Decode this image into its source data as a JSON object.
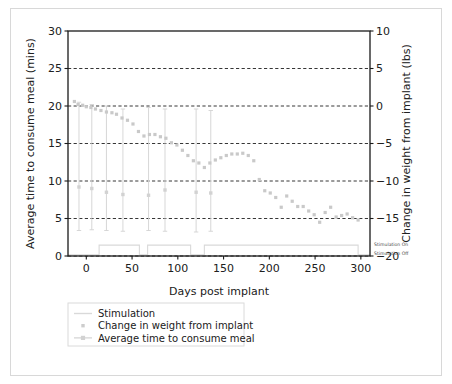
{
  "chart_data": {
    "type": "scatter",
    "title": "",
    "xlabel": "Days post implant",
    "ylabel": "Average time to consume meal (mins)",
    "y2label": "Change in weight from implant (lbs)",
    "xlim": [
      -20,
      310
    ],
    "ylim": [
      0,
      30
    ],
    "y2lim": [
      -20,
      10
    ],
    "xticks": [
      0,
      50,
      100,
      150,
      200,
      250,
      300
    ],
    "yticks": [
      0,
      5,
      10,
      15,
      20,
      25,
      30
    ],
    "y2ticks": [
      -20,
      -15,
      -10,
      -5,
      0,
      5,
      10
    ],
    "grid": true,
    "grid_style": "dashed horizontal",
    "legend_position": "below-left",
    "series": [
      {
        "name": "Stimulation",
        "type": "step",
        "marker": "line",
        "color": "#d9d9d9",
        "axis": "stimulation",
        "annotation_on": "Stimulation On",
        "annotation_off": "Stimulation Off",
        "points": [
          {
            "x": -20,
            "state": "off"
          },
          {
            "x": 14,
            "state": "on"
          },
          {
            "x": 58,
            "state": "off"
          },
          {
            "x": 67,
            "state": "on"
          },
          {
            "x": 114,
            "state": "off"
          },
          {
            "x": 129,
            "state": "on"
          },
          {
            "x": 297,
            "state": "off"
          },
          {
            "x": 310,
            "state": "off"
          }
        ]
      },
      {
        "name": "Change in weight from implant",
        "type": "scatter",
        "marker": "square",
        "color": "#c9c9c9",
        "axis": "right",
        "x": [
          -13,
          -9,
          -4,
          0,
          5,
          10,
          16,
          22,
          28,
          33,
          39,
          45,
          51,
          57,
          63,
          69,
          75,
          81,
          87,
          93,
          99,
          105,
          111,
          117,
          123,
          129,
          135,
          141,
          147,
          153,
          159,
          165,
          171,
          177,
          183,
          189,
          195,
          201,
          207,
          213,
          219,
          225,
          231,
          237,
          243,
          249,
          255,
          261,
          267,
          273,
          279,
          285,
          291,
          297
        ],
        "y": [
          0.6,
          0.2,
          0.1,
          -0.1,
          -0.2,
          -0.4,
          -0.6,
          -0.8,
          -0.9,
          -1.1,
          -1.6,
          -1.9,
          -2.4,
          -3.4,
          -4.0,
          -3.8,
          -3.8,
          -4.1,
          -4.3,
          -4.9,
          -5.2,
          -5.9,
          -6.6,
          -7.3,
          -7.6,
          -8.2,
          -7.6,
          -7.2,
          -6.9,
          -6.6,
          -6.4,
          -6.4,
          -6.3,
          -6.6,
          -7.3,
          -9.8,
          -11.3,
          -11.6,
          -12.2,
          -13.5,
          -12.0,
          -12.7,
          -13.4,
          -13.4,
          -14.0,
          -14.5,
          -15.5,
          -14.2,
          -13.5,
          -14.8,
          -14.6,
          -14.4,
          -14.9,
          -15.2
        ]
      },
      {
        "name": "Average time to consume meal",
        "type": "scatter-errorbar",
        "marker": "square",
        "color": "#d2d2d2",
        "axis": "left",
        "x": [
          -8,
          6,
          22,
          40,
          68,
          86,
          120,
          136
        ],
        "y": [
          9.2,
          9.0,
          8.5,
          8.2,
          8.1,
          8.8,
          8.5,
          8.4
        ],
        "yerr_low": [
          3.4,
          3.5,
          3.4,
          3.3,
          3.4,
          3.3,
          3.2,
          3.3
        ],
        "yerr_high": [
          20.5,
          20.2,
          20.0,
          19.6,
          19.8,
          19.6,
          19.6,
          19.4
        ]
      }
    ]
  },
  "axes": {
    "left": {
      "title": "Average time to consume meal (mins)",
      "ticks": [
        "0",
        "5",
        "10",
        "15",
        "20",
        "25",
        "30"
      ]
    },
    "right": {
      "title": "Change in weight from implant (lbs)",
      "ticks": [
        "−20",
        "−15",
        "−10",
        "−5",
        "0",
        "5",
        "10"
      ]
    },
    "bottom": {
      "title": "Days post implant",
      "ticks": [
        "0",
        "50",
        "100",
        "150",
        "200",
        "250",
        "300"
      ]
    }
  },
  "annotations": {
    "stimulation_on": "Stimulation On",
    "stimulation_off": "Stimulation Off"
  },
  "legend": {
    "items": [
      {
        "label": "Stimulation",
        "marker": "line",
        "color": "#d9d9d9"
      },
      {
        "label": "Change in weight from implant",
        "marker": "dot",
        "color": "#cdcdcd"
      },
      {
        "label": "Average time to consume meal",
        "marker": "square-line",
        "color": "#d2d2d2"
      }
    ]
  },
  "colors": {
    "axis": "#1a1a1a",
    "grid": "#1f1f1f",
    "stimulation": "#d9d9d9",
    "weight": "#c9c9c9",
    "meal": "#d2d2d2",
    "frame": "#d8d8d8",
    "background": "#ffffff"
  }
}
